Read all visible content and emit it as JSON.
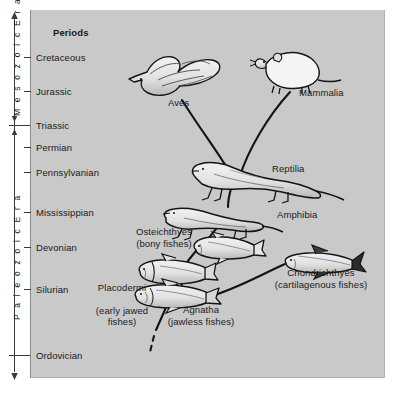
{
  "figure": {
    "panel_color": "#c9c9c9",
    "line_color": "#141414"
  },
  "time_axis": {
    "eras": [
      {
        "name": "Mesozoic Era",
        "label": "M e s o z o i c   E r a",
        "top": 14,
        "bottom": 126
      },
      {
        "name": "Paleozoic Era",
        "label": "P a l e o z o i c   E r a",
        "top": 126,
        "bottom": 376
      }
    ],
    "column_header": "Periods",
    "periods": [
      {
        "label": "Cretaceous",
        "y": 58
      },
      {
        "label": "Jurassic",
        "y": 92
      },
      {
        "label": "Triassic",
        "y": 126
      },
      {
        "label": "Permian",
        "y": 148
      },
      {
        "label": "Pennsylvanian",
        "y": 173
      },
      {
        "label": "Mississippian",
        "y": 213
      },
      {
        "label": "Devonian",
        "y": 248
      },
      {
        "label": "Silurian",
        "y": 290
      },
      {
        "label": "Ordovician",
        "y": 356
      }
    ]
  },
  "taxa": [
    {
      "id": "aves",
      "label": "Aves",
      "sublabel": "",
      "x": 168,
      "y": 102,
      "align": "left"
    },
    {
      "id": "mammalia",
      "label": "Mammalia",
      "sublabel": "",
      "x": 299,
      "y": 92,
      "align": "left"
    },
    {
      "id": "reptilia",
      "label": "Reptilia",
      "sublabel": "",
      "x": 272,
      "y": 168,
      "align": "left"
    },
    {
      "id": "amphibia",
      "label": "Amphibia",
      "sublabel": "",
      "x": 277,
      "y": 214,
      "align": "left"
    },
    {
      "id": "osteichthyes",
      "label": "Osteichthyes",
      "sublabel": "(bony fishes)",
      "x": 122,
      "y": 231,
      "align": "left"
    },
    {
      "id": "placodermi",
      "label": "Placodermi",
      "sublabel": "(early jawed\nfishes)",
      "x": 85,
      "y": 276,
      "align": "left"
    },
    {
      "id": "agnatha",
      "label": "Agnatha",
      "sublabel": "(jawless fishes)",
      "x": 163,
      "y": 309,
      "align": "left"
    },
    {
      "id": "chondrichthyes",
      "label": "Chondrichthyes",
      "sublabel": "(cartilagenous fishes)",
      "x": 267,
      "y": 272,
      "align": "left"
    }
  ],
  "connections": [
    {
      "from": "reptilia",
      "to": "aves",
      "style": "solid"
    },
    {
      "from": "reptilia",
      "to": "mammalia",
      "style": "solid"
    },
    {
      "from": "amphibia",
      "to": "reptilia",
      "style": "solid"
    },
    {
      "from": "osteichthyes",
      "to": "amphibia",
      "style": "solid"
    },
    {
      "from": "placodermi",
      "to": "osteichthyes",
      "style": "solid"
    },
    {
      "from": "agnatha",
      "to": "placodermi",
      "style": "solid"
    },
    {
      "from": "agnatha",
      "to": "chondrichthyes",
      "style": "solid"
    },
    {
      "from": "origin",
      "to": "agnatha",
      "style": "dashed"
    }
  ]
}
